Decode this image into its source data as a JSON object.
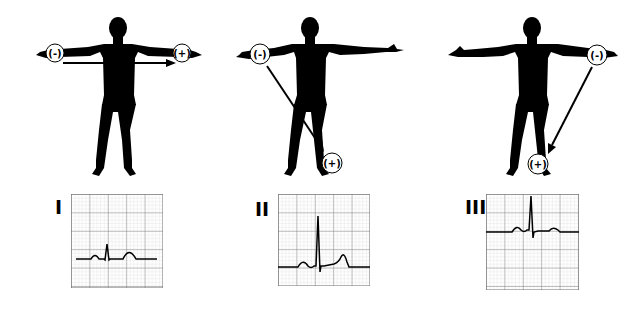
{
  "diagram": {
    "colors": {
      "silhouette": "#000000",
      "grid_minor": "#c8c8c8",
      "grid_major": "#6e6e6e",
      "trace": "#000000",
      "background": "#ffffff"
    },
    "leads": [
      {
        "label": "I",
        "negative_electrode": {
          "text": "(-)",
          "location": "right arm"
        },
        "positive_electrode": {
          "text": "(+)",
          "location": "left arm"
        },
        "arrow": "horizontal, right arm to left arm",
        "ecg": {
          "description": "small P, moderate R, T wave",
          "r_amplitude": "moderate"
        }
      },
      {
        "label": "II",
        "negative_electrode": {
          "text": "(-)",
          "location": "right arm"
        },
        "positive_electrode": {
          "text": "(+)",
          "location": "left leg"
        },
        "arrow": "diagonal, right arm to left leg",
        "ecg": {
          "description": "P, tall R, T wave",
          "r_amplitude": "tall"
        }
      },
      {
        "label": "III",
        "negative_electrode": {
          "text": "(-)",
          "location": "left arm"
        },
        "positive_electrode": {
          "text": "(+)",
          "location": "left leg"
        },
        "arrow": "diagonal, left arm to left leg",
        "ecg": {
          "description": "small P, tall R, small T wave",
          "r_amplitude": "tall"
        }
      }
    ]
  }
}
